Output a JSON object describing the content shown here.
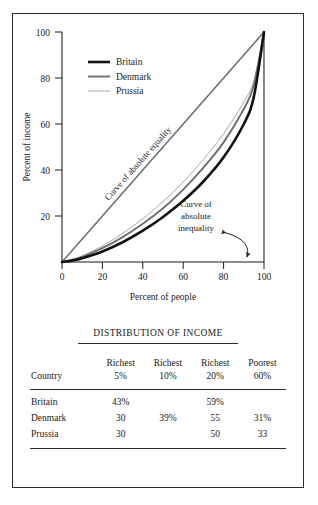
{
  "figure": {
    "caption_title": "DISTRIBUTION OF INCOME"
  },
  "chart_data": {
    "type": "line",
    "title": "",
    "xlabel": "Percent of people",
    "ylabel": "Percent of income",
    "xlim": [
      0,
      100
    ],
    "ylim": [
      0,
      100
    ],
    "xticks": [
      "0",
      "20",
      "40",
      "60",
      "80",
      "100"
    ],
    "yticks": [
      "20",
      "40",
      "60",
      "80",
      "100"
    ],
    "xtick_values": [
      0,
      20,
      40,
      60,
      80,
      100
    ],
    "ytick_values": [
      20,
      40,
      60,
      80,
      100
    ],
    "grid": false,
    "legend_position": "upper-left",
    "annotations": [
      {
        "name": "equality-line-label",
        "text": "Curve of absolute equality"
      },
      {
        "name": "inequality-label",
        "text": "Curve of absolute inequality",
        "lines": [
          "Curve of",
          "absolute",
          "inequality"
        ]
      }
    ],
    "series": [
      {
        "name": "Britain",
        "color": "#121212",
        "width": 2.6,
        "x": [
          0,
          5,
          10,
          20,
          30,
          40,
          50,
          60,
          70,
          80,
          90,
          95,
          100
        ],
        "y": [
          0,
          0.6,
          1.6,
          4.6,
          8.6,
          13.6,
          19.6,
          26.6,
          35.0,
          45.5,
          60.0,
          72.0,
          100
        ]
      },
      {
        "name": "Denmark",
        "color": "#6f6f6f",
        "width": 1.9,
        "x": [
          0,
          5,
          10,
          20,
          30,
          40,
          50,
          60,
          70,
          80,
          90,
          95,
          100
        ],
        "y": [
          0,
          0.9,
          2.2,
          6.0,
          10.8,
          16.6,
          23.4,
          31.5,
          41.0,
          52.0,
          66.5,
          77.0,
          100
        ]
      },
      {
        "name": "Prussia",
        "color": "#a8a8a8",
        "width": 1.0,
        "x": [
          0,
          5,
          10,
          20,
          30,
          40,
          50,
          60,
          70,
          80,
          90,
          95,
          100
        ],
        "y": [
          0,
          1.1,
          2.7,
          7.0,
          12.4,
          18.8,
          26.2,
          34.8,
          44.6,
          55.8,
          69.5,
          79.0,
          100
        ]
      },
      {
        "name": "Curve of absolute equality",
        "color": "#6f6f6f",
        "width": 1.6,
        "x": [
          0,
          100
        ],
        "y": [
          0,
          100
        ]
      }
    ],
    "legend": [
      {
        "label": "Britain",
        "color": "#121212",
        "width": 2.6
      },
      {
        "label": "Denmark",
        "color": "#6f6f6f",
        "width": 1.9
      },
      {
        "label": "Prussia",
        "color": "#a8a8a8",
        "width": 1.0
      }
    ]
  },
  "table": {
    "headers_top": [
      "",
      "Richest",
      "Richest",
      "Richest",
      "Poorest"
    ],
    "headers_bottom": [
      "Country",
      "5%",
      "10%",
      "20%",
      "60%"
    ],
    "rows": [
      {
        "country": "Britain",
        "values": [
          "43%",
          "",
          "59%",
          ""
        ]
      },
      {
        "country": "Denmark",
        "values": [
          "30",
          "39%",
          "55",
          "31%"
        ]
      },
      {
        "country": "Prussia",
        "values": [
          "30",
          "",
          "50",
          "33"
        ]
      }
    ]
  }
}
